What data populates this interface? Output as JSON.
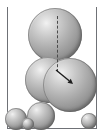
{
  "figure": {
    "width": 104,
    "height": 136,
    "background_color": "#ffffff",
    "caption": ""
  },
  "container": {
    "name": "rectangular container",
    "line_color": "#6f7176",
    "line_width": 1,
    "left_wall": {
      "x": 7,
      "y": 7,
      "height": 122
    },
    "right_wall": {
      "x": 96,
      "y": 7,
      "height": 122
    },
    "floor": {
      "x": 7,
      "y": 128,
      "width": 90
    },
    "open_top": true
  },
  "style": {
    "sphere_highlight_color": "#f2f2f2",
    "sphere_mid_color": "#b0b0b0",
    "sphere_shadow_color": "#6c6c6c",
    "sphere_outline_color": "#5f5f5f",
    "dash_color": "#4a4a4a",
    "arrow_color": "#1d1d1d"
  },
  "chart_data": {
    "type": "scatter",
    "title": "",
    "xlabel": "",
    "ylabel": "",
    "xlim": [
      0,
      104
    ],
    "ylim": [
      0,
      136
    ],
    "grid": false,
    "legend": "none",
    "note": "Discrete-element style rendering: shaded spheres packed in a container; marker size encodes particle radius in pixels.",
    "series": [
      {
        "name": "particles",
        "points": [
          {
            "id": "sphere-top",
            "label": "large upper sphere",
            "x": 55,
            "y": 35,
            "r": 27
          },
          {
            "id": "sphere-middle-left",
            "label": "middle-left sphere",
            "x": 48,
            "y": 80,
            "r": 23
          },
          {
            "id": "sphere-middle-right",
            "label": "large right sphere",
            "x": 70,
            "y": 85,
            "r": 27
          },
          {
            "id": "sphere-bottom-mid",
            "label": "bottom middle sphere",
            "x": 41,
            "y": 116,
            "r": 14
          },
          {
            "id": "sphere-bottom-left",
            "label": "bottom left sphere",
            "x": 16,
            "y": 119,
            "r": 11
          },
          {
            "id": "sphere-bottom-tiny",
            "label": "bottom tiny sphere",
            "x": 28,
            "y": 124,
            "r": 6
          },
          {
            "id": "sphere-bottom-right",
            "label": "bottom right sphere",
            "x": 89,
            "y": 121,
            "r": 8
          }
        ]
      }
    ],
    "annotations": [
      {
        "id": "centerline",
        "type": "dashed-line",
        "label": "vertical centre axis",
        "x1": 57,
        "y1": 16,
        "x2": 57,
        "y2": 72,
        "color": "#4a4a4a",
        "dash": true
      },
      {
        "id": "vector-arrow",
        "type": "arrow",
        "label": "force vector",
        "x1": 56,
        "y1": 70,
        "x2": 73,
        "y2": 84,
        "color": "#1d1d1d"
      }
    ]
  }
}
